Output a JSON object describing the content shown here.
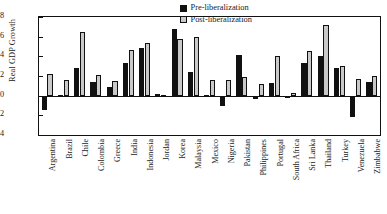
{
  "chart_data": {
    "type": "bar",
    "title": "",
    "xlabel": "",
    "ylabel": "Real GDP Growth",
    "ylim": [
      -0.04,
      0.08
    ],
    "yticks": [
      "0.08",
      "0.06",
      "0.04",
      "0.02",
      "0",
      "-0.02",
      "-0.04"
    ],
    "ytick_values": [
      0.08,
      0.06,
      0.04,
      0.02,
      0,
      -0.02,
      -0.04
    ],
    "grid": false,
    "legend_position": "top-right",
    "categories": [
      "Argentina",
      "Brazil",
      "Chile",
      "Colombia",
      "Greece",
      "India",
      "Indonesia",
      "Jordan",
      "Korea",
      "Malaysia",
      "Mexico",
      "Nigeria",
      "Pakistan",
      "Philippines",
      "Portugal",
      "South Africa",
      "Sri Lanka",
      "Thailand",
      "Turkey",
      "Venezuela",
      "Zimbabwe"
    ],
    "series": [
      {
        "name": "Pre-liberalization",
        "color": "#111111",
        "values": [
          -0.015,
          0.001,
          0.028,
          0.014,
          0.009,
          0.033,
          0.048,
          0.002,
          0.068,
          0.024,
          0.001,
          -0.011,
          0.041,
          -0.003,
          0.013,
          -0.002,
          0.033,
          0.04,
          0.028,
          -0.022,
          0.014
        ]
      },
      {
        "name": "Post-liberalization",
        "color": "#c9c9c9",
        "values": [
          0.022,
          0.016,
          0.065,
          0.021,
          0.015,
          0.046,
          0.054,
          0.001,
          0.058,
          0.06,
          0.016,
          0.016,
          0.019,
          0.012,
          0.04,
          0.003,
          0.045,
          0.072,
          0.03,
          0.017,
          0.02
        ]
      }
    ]
  }
}
